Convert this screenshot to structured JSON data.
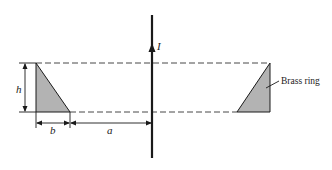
{
  "diagram": {
    "type": "physics-figure",
    "labels": {
      "current": "I",
      "height": "h",
      "base": "b",
      "distance": "a",
      "ring": "Brass ring"
    },
    "colors": {
      "line": "#1a1a1a",
      "fill": "#b3b3b3",
      "dash": "#333333"
    }
  }
}
